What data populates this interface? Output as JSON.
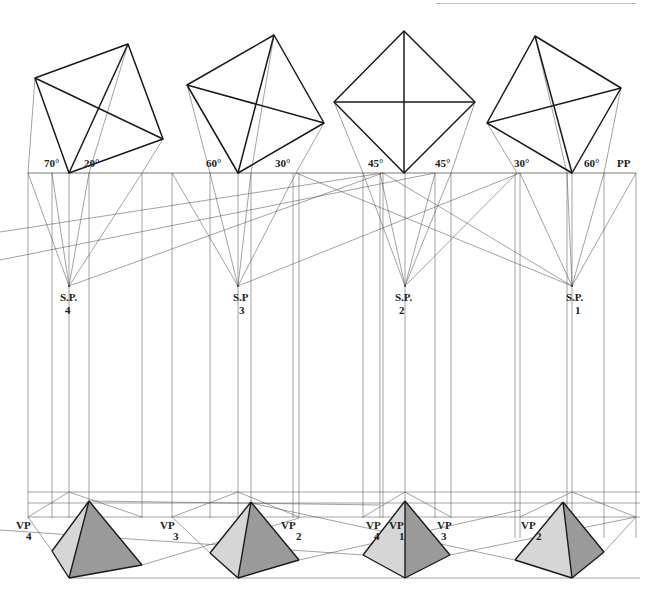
{
  "figure": {
    "picture_plane_label": "PP",
    "colors": {
      "line": "#1a1a1a",
      "construction": "#555555",
      "face_light": "#d6d6d6",
      "face_dark": "#9a9a9a",
      "background": "#ffffff"
    },
    "picture_plane_y": 173,
    "horizon_y": 492,
    "horizon_y2": 503,
    "ground_line_y": 518
  },
  "plans": [
    {
      "id": "sp4",
      "angles": [
        "70°",
        "20°"
      ],
      "angle_label_pos": [
        [
          44,
          167
        ],
        [
          84,
          167
        ]
      ],
      "square": [
        [
          69,
          173
        ],
        [
          35,
          78
        ],
        [
          128,
          44
        ],
        [
          163,
          139
        ]
      ],
      "diagonals": [
        [
          [
            69,
            173
          ],
          [
            128,
            44
          ]
        ],
        [
          [
            35,
            78
          ],
          [
            163,
            139
          ]
        ]
      ],
      "station_point": [
        69,
        286
      ],
      "sp_label": "S.P.",
      "sp_number": "4",
      "sp_label_pos": [
        60,
        301
      ],
      "sp_number_pos": [
        65,
        314
      ]
    },
    {
      "id": "sp3",
      "angles": [
        "60°",
        "30°"
      ],
      "angle_label_pos": [
        [
          206,
          167
        ],
        [
          275,
          167
        ]
      ],
      "square": [
        [
          238,
          173
        ],
        [
          187,
          85
        ],
        [
          274,
          35
        ],
        [
          324,
          123
        ]
      ],
      "diagonals": [
        [
          [
            238,
            173
          ],
          [
            274,
            35
          ]
        ],
        [
          [
            187,
            85
          ],
          [
            324,
            123
          ]
        ]
      ],
      "station_point": [
        238,
        286
      ],
      "sp_label": "S.P",
      "sp_number": "3",
      "sp_label_pos": [
        233,
        301
      ],
      "sp_number_pos": [
        239,
        314
      ]
    },
    {
      "id": "sp2",
      "angles": [
        "45°",
        "45°"
      ],
      "angle_label_pos": [
        [
          368,
          167
        ],
        [
          435,
          167
        ]
      ],
      "square": [
        [
          404,
          173
        ],
        [
          334,
          102
        ],
        [
          404,
          31
        ],
        [
          475,
          102
        ]
      ],
      "diagonals": [
        [
          [
            404,
            173
          ],
          [
            404,
            31
          ]
        ],
        [
          [
            334,
            102
          ],
          [
            475,
            102
          ]
        ]
      ],
      "station_point": [
        405,
        286
      ],
      "sp_label": "S.P.",
      "sp_number": "2",
      "sp_label_pos": [
        395,
        301
      ],
      "sp_number_pos": [
        399,
        314
      ]
    },
    {
      "id": "sp1",
      "angles": [
        "30°",
        "60°"
      ],
      "angle_label_pos": [
        [
          514,
          167
        ],
        [
          584,
          167
        ]
      ],
      "square": [
        [
          572,
          173
        ],
        [
          487,
          123
        ],
        [
          535,
          36
        ],
        [
          621,
          88
        ]
      ],
      "diagonals": [
        [
          [
            572,
            173
          ],
          [
            535,
            36
          ]
        ],
        [
          [
            487,
            123
          ],
          [
            621,
            88
          ]
        ]
      ],
      "station_point": [
        572,
        286
      ],
      "sp_label": "S.P.",
      "sp_number": "1",
      "sp_label_pos": [
        566,
        301
      ],
      "sp_number_pos": [
        575,
        314
      ]
    }
  ],
  "picture_plane": {
    "x1": 28,
    "x2": 636,
    "label_pos": [
      617,
      167
    ]
  },
  "verticals": [
    28,
    52,
    69,
    89,
    142,
    172,
    210,
    238,
    251,
    293,
    299,
    363,
    380,
    383,
    405,
    435,
    451,
    515,
    520,
    567,
    572,
    604,
    636
  ],
  "construction_lines": [
    [
      [
        69,
        286
      ],
      [
        28,
        173
      ]
    ],
    [
      [
        69,
        286
      ],
      [
        52,
        173
      ]
    ],
    [
      [
        69,
        286
      ],
      [
        89,
        173
      ]
    ],
    [
      [
        69,
        286
      ],
      [
        142,
        173
      ]
    ],
    [
      [
        69,
        286
      ],
      [
        383,
        173
      ]
    ],
    [
      [
        238,
        286
      ],
      [
        172,
        173
      ]
    ],
    [
      [
        238,
        286
      ],
      [
        210,
        173
      ]
    ],
    [
      [
        238,
        286
      ],
      [
        251,
        173
      ]
    ],
    [
      [
        238,
        286
      ],
      [
        296,
        173
      ]
    ],
    [
      [
        238,
        286
      ],
      [
        520,
        173
      ]
    ],
    [
      [
        296,
        173
      ],
      [
        572,
        286
      ]
    ],
    [
      [
        405,
        286
      ],
      [
        363,
        173
      ]
    ],
    [
      [
        405,
        286
      ],
      [
        380,
        173
      ]
    ],
    [
      [
        405,
        286
      ],
      [
        435,
        173
      ]
    ],
    [
      [
        405,
        286
      ],
      [
        451,
        173
      ]
    ],
    [
      [
        383,
        173
      ],
      [
        572,
        286
      ]
    ],
    [
      [
        405,
        286
      ],
      [
        517,
        173
      ]
    ],
    [
      [
        0,
        260
      ],
      [
        435,
        173
      ]
    ],
    [
      [
        0,
        232
      ],
      [
        383,
        173
      ]
    ],
    [
      [
        572,
        286
      ],
      [
        520,
        173
      ]
    ],
    [
      [
        572,
        286
      ],
      [
        567,
        173
      ]
    ],
    [
      [
        572,
        286
      ],
      [
        604,
        173
      ]
    ],
    [
      [
        572,
        286
      ],
      [
        636,
        173
      ]
    ],
    [
      [
        35,
        78
      ],
      [
        28,
        173
      ]
    ],
    [
      [
        163,
        139
      ],
      [
        142,
        173
      ]
    ],
    [
      [
        128,
        44
      ],
      [
        89,
        173
      ]
    ],
    [
      [
        187,
        85
      ],
      [
        210,
        173
      ]
    ],
    [
      [
        324,
        123
      ],
      [
        296,
        173
      ]
    ],
    [
      [
        274,
        35
      ],
      [
        251,
        173
      ]
    ],
    [
      [
        334,
        102
      ],
      [
        363,
        173
      ]
    ],
    [
      [
        475,
        102
      ],
      [
        451,
        173
      ]
    ],
    [
      [
        487,
        123
      ],
      [
        517,
        173
      ]
    ],
    [
      [
        621,
        88
      ],
      [
        604,
        173
      ]
    ],
    [
      [
        535,
        36
      ],
      [
        567,
        173
      ]
    ]
  ],
  "perspectives": [
    {
      "id": "p4",
      "vp_left": {
        "label": "VP",
        "number": "4",
        "label_pos": [
          16,
          529
        ],
        "number_pos": [
          26,
          540
        ]
      },
      "vp_left_pt": [
        28,
        517
      ],
      "apex": [
        89,
        501
      ],
      "front": [
        69,
        578
      ],
      "left": [
        52,
        551
      ],
      "right": [
        142,
        565
      ],
      "back": [
        69,
        493
      ]
    },
    {
      "id": "p3",
      "vp_left": {
        "label": "VP",
        "number": "3",
        "label_pos": [
          160,
          529
        ],
        "number_pos": [
          173,
          540
        ]
      },
      "vp_left_pt": [
        172,
        517
      ],
      "apex": [
        251,
        502
      ],
      "front": [
        238,
        578
      ],
      "left": [
        210,
        553
      ],
      "right": [
        299,
        560
      ],
      "back": [
        238,
        492
      ]
    },
    {
      "id": "p1",
      "vp_left": {
        "label": "VP",
        "number": "4",
        "label_pos": [
          366,
          529
        ],
        "number_pos": [
          374,
          540
        ]
      },
      "vp_mid": {
        "label": "VP",
        "number": "1",
        "label_pos": [
          389,
          529
        ],
        "number_pos": [
          399,
          540
        ]
      },
      "vp_right": {
        "label": "VP",
        "number": "3",
        "label_pos": [
          437,
          529
        ],
        "number_pos": [
          441,
          540
        ]
      },
      "apex": [
        405,
        501
      ],
      "front": [
        405,
        578
      ],
      "left": [
        363,
        555
      ],
      "right": [
        450,
        555
      ],
      "back": [
        405,
        492
      ]
    },
    {
      "id": "p2",
      "vp_left": {
        "label": "VP",
        "number": "2",
        "label_pos": [
          521,
          529
        ],
        "number_pos": [
          536,
          540
        ]
      },
      "vp_left_pt": [
        520,
        517
      ],
      "apex": [
        563,
        502
      ],
      "front": [
        572,
        578
      ],
      "left": [
        515,
        560
      ],
      "right": [
        604,
        552
      ],
      "back": [
        572,
        492
      ]
    },
    {
      "id": "p3b",
      "vp_right": {
        "label": "VP",
        "number": "2",
        "label_pos": [
          281,
          529
        ],
        "number_pos": [
          296,
          540
        ]
      }
    }
  ],
  "perspective_construction": [
    [
      [
        28,
        492
      ],
      [
        640,
        492
      ]
    ],
    [
      [
        28,
        503
      ],
      [
        640,
        503
      ]
    ],
    [
      [
        28,
        517
      ],
      [
        640,
        517
      ]
    ],
    [
      [
        69,
        492
      ],
      [
        142,
        517
      ]
    ],
    [
      [
        69,
        492
      ],
      [
        28,
        517
      ]
    ],
    [
      [
        89,
        501
      ],
      [
        380,
        505
      ]
    ],
    [
      [
        238,
        492
      ],
      [
        172,
        517
      ]
    ],
    [
      [
        238,
        492
      ],
      [
        299,
        517
      ]
    ],
    [
      [
        405,
        492
      ],
      [
        363,
        517
      ]
    ],
    [
      [
        405,
        492
      ],
      [
        451,
        517
      ]
    ],
    [
      [
        572,
        492
      ],
      [
        520,
        517
      ]
    ],
    [
      [
        572,
        492
      ],
      [
        636,
        517
      ]
    ],
    [
      [
        28,
        517
      ],
      [
        52,
        551
      ]
    ],
    [
      [
        142,
        565
      ],
      [
        299,
        518
      ]
    ],
    [
      [
        172,
        517
      ],
      [
        210,
        553
      ]
    ],
    [
      [
        299,
        560
      ],
      [
        520,
        510
      ]
    ],
    [
      [
        0,
        530
      ],
      [
        363,
        555
      ]
    ],
    [
      [
        251,
        503
      ],
      [
        515,
        560
      ]
    ],
    [
      [
        450,
        555
      ],
      [
        636,
        517
      ]
    ],
    [
      [
        604,
        552
      ],
      [
        636,
        517
      ]
    ],
    [
      [
        69,
        578
      ],
      [
        640,
        578
      ]
    ]
  ]
}
